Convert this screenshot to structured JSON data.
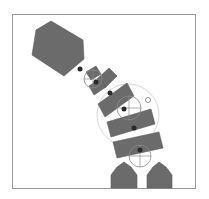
{
  "scene": {
    "title": "Articulated body simulation",
    "background": "#ffffff",
    "frame": {
      "x": 12.5,
      "y": 14.5,
      "w": 183,
      "h": 174,
      "stroke": "#9a9a9a",
      "floor_stroke": "#a0a0a0"
    },
    "colors": {
      "body": "#6b6b6b",
      "body_stroke": "#5c5c5c",
      "joint": "#2a2a2a",
      "joint_ring": "#8a8a8a",
      "range_ring": "#d8d8d8"
    }
  },
  "bodies": [
    {
      "name": "head-block",
      "points": "36,30 51,21 83,40 84,59 64,76 32,55"
    },
    {
      "name": "neck-small-block",
      "points": "86,72 96,66 101,74 91,80"
    },
    {
      "name": "segment-1",
      "points": "97,79 109,68 117,76 105,88"
    },
    {
      "name": "segment-1b",
      "points": "89,86 101,78 106,87 94,95"
    },
    {
      "name": "segment-2",
      "points": "98,104 127,83 134,96 105,117"
    },
    {
      "name": "segment-3",
      "points": "107,122 151,109 155,124 111,137"
    },
    {
      "name": "segment-4",
      "points": "113,142 159,132 163,148 117,158"
    },
    {
      "name": "left-foot",
      "points": "111,175 117,167 124,162 131,167 137,175 137,188 111,188"
    },
    {
      "name": "right-foot",
      "points": "147,175 153,167 159,162 166,167 172,175 172,188 147,188"
    }
  ],
  "joints": [
    {
      "name": "neck-joint",
      "cx": 80,
      "cy": 69,
      "r": 2.5
    },
    {
      "name": "spine-joint-1",
      "cx": 96,
      "cy": 82,
      "r": 2.5
    },
    {
      "name": "spine-joint-2",
      "cx": 110,
      "cy": 93,
      "r": 2.5
    },
    {
      "name": "spine-joint-3",
      "cx": 124,
      "cy": 109,
      "r": 2.5
    },
    {
      "name": "spine-joint-4",
      "cx": 134,
      "cy": 128,
      "r": 2.5
    },
    {
      "name": "spine-joint-5",
      "cx": 140,
      "cy": 150,
      "r": 2.5
    }
  ],
  "joint_gizmos": [
    {
      "name": "neck-gizmo",
      "cx": 93,
      "cy": 79,
      "r": 9
    },
    {
      "name": "spine-gizmo",
      "cx": 129,
      "cy": 108,
      "r": 12
    },
    {
      "name": "hip-gizmo",
      "cx": 140,
      "cy": 156,
      "r": 11
    }
  ],
  "range_rings": [
    {
      "name": "torso-range-ring",
      "cx": 128,
      "cy": 115,
      "r": 31
    }
  ],
  "markers": [
    {
      "name": "target-marker",
      "cx": 148,
      "cy": 100,
      "r": 2.5
    }
  ]
}
